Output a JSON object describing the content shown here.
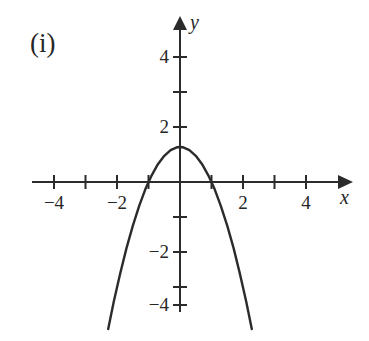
{
  "figure": {
    "panel_label": "(i)",
    "background_color": "#ffffff",
    "stroke_color": "#2b2b2b",
    "text_color": "#262626"
  },
  "axes": {
    "x_axis_name": "x",
    "y_axis_name": "y",
    "x_tick_labels": [
      {
        "value": -4,
        "text": "−4"
      },
      {
        "value": -2,
        "text": "−2"
      },
      {
        "value": 2,
        "text": "2"
      },
      {
        "value": 4,
        "text": "4"
      }
    ],
    "y_tick_labels": [
      {
        "value": 4,
        "text": "4"
      },
      {
        "value": 2,
        "text": "2"
      },
      {
        "value": -2,
        "text": "−2"
      },
      {
        "value": -4,
        "text": "−4"
      }
    ],
    "x_ticks_all": [
      -4,
      -3,
      -2,
      -1,
      1,
      2,
      3,
      4
    ],
    "y_ticks_all": [
      4,
      3,
      2,
      1,
      -1,
      -2,
      -3,
      -4
    ],
    "origin_px": {
      "x": 180,
      "y": 182
    },
    "unit_px": {
      "x": 31.5,
      "y": 35
    },
    "x_arrow": true,
    "y_arrow": true
  },
  "chart_data": {
    "type": "line",
    "title": "(i)",
    "xlabel": "x",
    "ylabel": "y",
    "grid": false,
    "legend": null,
    "xlim": [
      -4.7,
      5.2
    ],
    "ylim": [
      -4.7,
      4.7
    ],
    "xticks": [
      -4,
      -3,
      -2,
      -1,
      1,
      2,
      3,
      4
    ],
    "yticks": [
      -4,
      -3,
      -2,
      -1,
      1,
      2,
      3,
      4
    ],
    "xticklabels": [
      "−4",
      "",
      "−2",
      "",
      "2",
      "",
      "4",
      ""
    ],
    "yticklabels": [
      "−4",
      "",
      "−2",
      "",
      "2",
      "",
      "4",
      ""
    ],
    "series": [
      {
        "name": "y = 1 - x^2",
        "equation": "y = 1 − x²",
        "vertex": [
          0,
          1
        ],
        "x_intercepts": [
          -1,
          1
        ],
        "y_intercept": 1,
        "opens": "down",
        "x_domain": [
          -2.28,
          2.28
        ],
        "x": [
          -2.28,
          -2.1,
          -1.9,
          -1.7,
          -1.5,
          -1.3,
          -1.1,
          -0.9,
          -0.7,
          -0.5,
          -0.3,
          -0.1,
          0,
          0.1,
          0.3,
          0.5,
          0.7,
          0.9,
          1.1,
          1.3,
          1.5,
          1.7,
          1.9,
          2.1,
          2.28
        ],
        "y": [
          -4.2,
          -3.41,
          -2.61,
          -1.89,
          -1.25,
          -0.69,
          -0.21,
          0.19,
          0.51,
          0.75,
          0.91,
          0.99,
          1,
          0.99,
          0.91,
          0.75,
          0.51,
          0.19,
          -0.21,
          -0.69,
          -1.25,
          -1.89,
          -2.61,
          -3.41,
          -4.2
        ]
      }
    ]
  }
}
